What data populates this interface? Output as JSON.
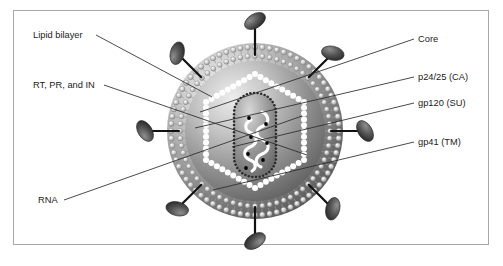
{
  "figure": {
    "frame_color": "#a8a8a8",
    "background": "#ffffff"
  },
  "labels": {
    "left": [
      {
        "id": "lipid-bilayer",
        "text": "Lipid bilayer",
        "x": 33,
        "y": 38,
        "leader": [
          [
            96,
            35
          ],
          [
            212,
            97
          ]
        ]
      },
      {
        "id": "rt-pr-in",
        "text": "RT, PR, and IN",
        "x": 33,
        "y": 88,
        "leader": [
          [
            104,
            85
          ],
          [
            307,
            155
          ]
        ]
      },
      {
        "id": "rna",
        "text": "RNA",
        "x": 38,
        "y": 203,
        "leader": [
          [
            64,
            200
          ],
          [
            302,
            116
          ]
        ]
      }
    ],
    "right": [
      {
        "id": "core",
        "text": "Core",
        "x": 418,
        "y": 42,
        "leader": [
          [
            414,
            39
          ],
          [
            200,
            112
          ]
        ]
      },
      {
        "id": "p24-25-ca",
        "text": "p24/25 (CA)",
        "x": 418,
        "y": 80,
        "leader": [
          [
            414,
            77
          ],
          [
            195,
            128
          ]
        ]
      },
      {
        "id": "gp120-su",
        "text": "gp120 (SU)",
        "x": 418,
        "y": 106,
        "leader": [
          [
            414,
            103
          ],
          [
            232,
            147
          ]
        ]
      },
      {
        "id": "gp41-tm",
        "text": "gp41 (TM)",
        "x": 418,
        "y": 145,
        "leader": [
          [
            414,
            142
          ],
          [
            213,
            190
          ]
        ]
      }
    ]
  },
  "virion": {
    "center_x": 255,
    "center_y": 131,
    "envelope_radius": 88,
    "membrane_radius": 76,
    "capsid_radius": 57,
    "colors": {
      "envelope_light": "#e8e8e8",
      "envelope_mid": "#9a9a9a",
      "envelope_dark": "#5c5c5c",
      "capsid_dot": "#ffffff",
      "spike_head": "#555555",
      "spike_stalk": "#111111",
      "rna_strand": "#ffffff",
      "enzyme_dot": "#000000",
      "leader_line": "#2b2b2b"
    },
    "spikes": [
      {
        "angle": -90,
        "name": "spike-top"
      },
      {
        "angle": -45,
        "name": "spike-top-right"
      },
      {
        "angle": 0,
        "name": "spike-right"
      },
      {
        "angle": 45,
        "name": "spike-bottom-right"
      },
      {
        "angle": 90,
        "name": "spike-bottom"
      },
      {
        "angle": 135,
        "name": "spike-bottom-left"
      },
      {
        "angle": 180,
        "name": "spike-left"
      },
      {
        "angle": 225,
        "name": "spike-top-left"
      }
    ],
    "spike_count": 8,
    "capsid_shape": "hexagon",
    "nucleocapsid_shape": "rounded-capsule",
    "rna_strand_count": 2,
    "enzyme_dot_count": 7
  }
}
